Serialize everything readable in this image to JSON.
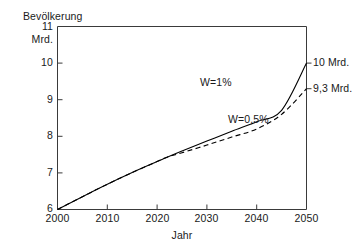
{
  "chart_data": {
    "type": "line",
    "title": "",
    "ylabel": "Bevölkerung",
    "yunit": "Mrd.",
    "xlabel": "Jahr",
    "xlim": [
      2000,
      2050
    ],
    "ylim": [
      6,
      11
    ],
    "grid": false,
    "legend_position": "inline-annotations",
    "x_ticks": [
      "2000",
      "2010",
      "2020",
      "2030",
      "2040",
      "2050"
    ],
    "x_tick_values": [
      2000,
      2010,
      2020,
      2030,
      2040,
      2050
    ],
    "y_ticks": [
      "6",
      "7",
      "8",
      "9",
      "10",
      "11"
    ],
    "y_tick_values": [
      6,
      7,
      8,
      9,
      10,
      11
    ],
    "x": [
      2000,
      2005,
      2010,
      2015,
      2020,
      2022,
      2025,
      2030,
      2035,
      2040,
      2045,
      2050
    ],
    "series": [
      {
        "name": "W=1%",
        "style": "solid",
        "color": "#000000",
        "values": [
          6.0,
          6.35,
          6.69,
          7.01,
          7.31,
          7.43,
          7.6,
          7.87,
          8.14,
          8.4,
          8.71,
          10.0
        ],
        "end_label": "10 Mrd.",
        "end_value": 10.0,
        "annotation": "W=1%"
      },
      {
        "name": "W=0,5%",
        "style": "dashed",
        "color": "#000000",
        "values": [
          6.0,
          6.35,
          6.69,
          7.01,
          7.31,
          7.43,
          7.55,
          7.76,
          7.98,
          8.2,
          8.6,
          9.3
        ],
        "end_label": "9,3 Mrd.",
        "end_value": 9.3,
        "annotation": "W=0,5%"
      }
    ],
    "annotations": [
      {
        "text": "W=1%",
        "x": 2029,
        "y": 9.35
      },
      {
        "text": "W=0,5%",
        "x": 2035,
        "y": 8.25
      },
      {
        "text": "10 Mrd.",
        "x": 2051,
        "y": 10.0
      },
      {
        "text": "9,3 Mrd.",
        "x": 2051,
        "y": 9.3
      }
    ]
  }
}
